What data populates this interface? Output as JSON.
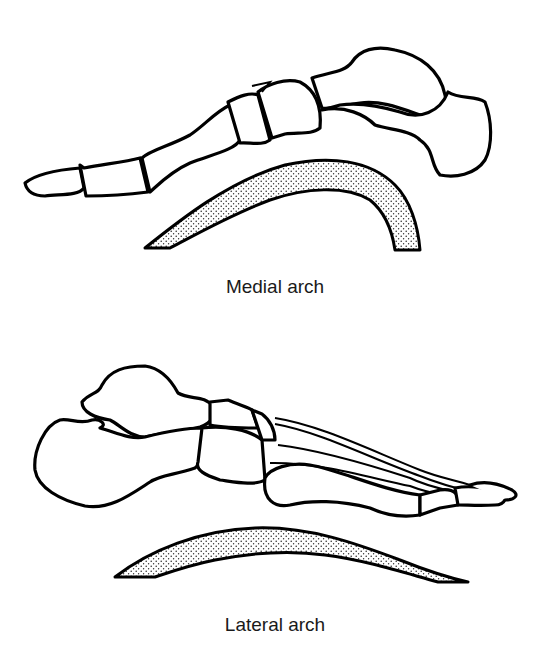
{
  "figure": {
    "panels": [
      {
        "id": "medial",
        "caption": "Medial arch",
        "illustration": "medial-foot-bones",
        "arch_shape": "high-curved-stippled-arc"
      },
      {
        "id": "lateral",
        "caption": "Lateral arch",
        "illustration": "lateral-foot-bones",
        "arch_shape": "low-flat-stippled-arc"
      }
    ],
    "colors": {
      "line": "#000000",
      "background": "#ffffff",
      "stipple": "#000000"
    }
  }
}
